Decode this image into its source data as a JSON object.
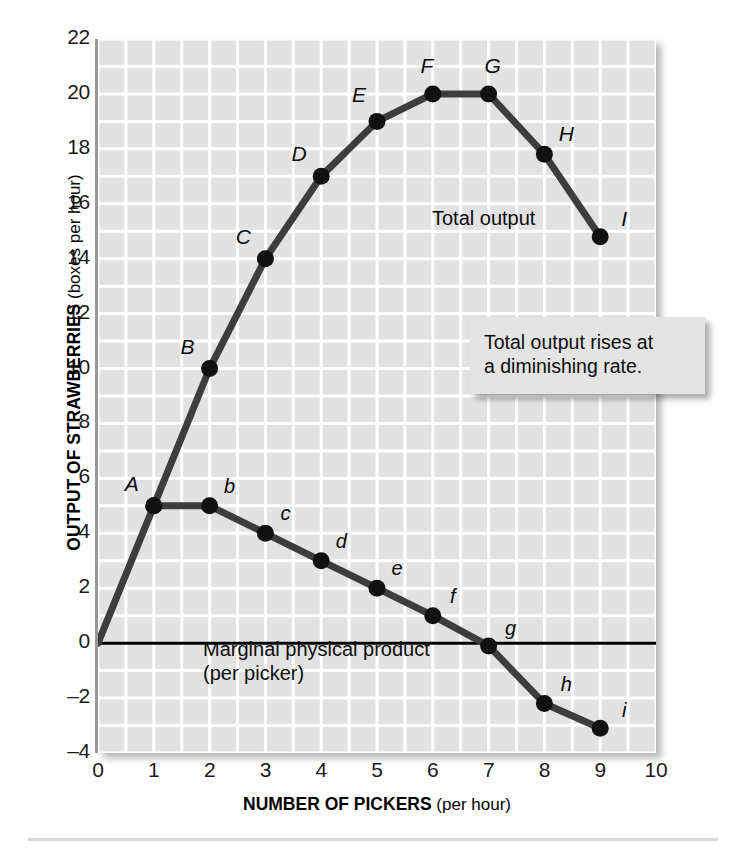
{
  "chart_data": {
    "type": "line",
    "title": "",
    "xlabel": "NUMBER OF PICKERS",
    "xlabel_sub": "(per hour)",
    "ylabel": "OUTPUT OF STRAWBERRIES",
    "ylabel_sub": "(boxes per hour)",
    "xlim": [
      0,
      10
    ],
    "ylim": [
      -4,
      22
    ],
    "xticks": [
      "0",
      "1",
      "2",
      "3",
      "4",
      "5",
      "6",
      "7",
      "8",
      "9",
      "10"
    ],
    "xtick_values": [
      0,
      1,
      2,
      3,
      4,
      5,
      6,
      7,
      8,
      9,
      10
    ],
    "yticks": [
      "22",
      "20",
      "18",
      "16",
      "14",
      "12",
      "10",
      "8",
      "6",
      "4",
      "2",
      "0",
      "–2",
      "–4"
    ],
    "ytick_values": [
      22,
      20,
      18,
      16,
      14,
      12,
      10,
      8,
      6,
      4,
      2,
      0,
      -2,
      -4
    ],
    "grid": true,
    "grid_x_step": 0.5,
    "grid_y_step": 1,
    "grid_color": "#ffffff",
    "plot_bg": "#e2e2e2",
    "legend": "none",
    "series": [
      {
        "name": "Total output",
        "label": "Total output",
        "color": "#3d3d3d",
        "x": [
          0,
          1,
          2,
          3,
          4,
          5,
          6,
          7,
          8,
          9
        ],
        "values": [
          0,
          5,
          10,
          14,
          17,
          19,
          20,
          20,
          17.8,
          14.8
        ],
        "point_labels": [
          "",
          "A",
          "B",
          "C",
          "D",
          "E",
          "F",
          "G",
          "H",
          "I"
        ]
      },
      {
        "name": "Marginal physical product",
        "label": "Marginal physical product",
        "label_sub": "(per picker)",
        "color": "#3d3d3d",
        "x": [
          1,
          2,
          3,
          4,
          5,
          6,
          7,
          8,
          9
        ],
        "values": [
          5,
          5,
          4,
          3,
          2,
          1,
          -0.1,
          -2.2,
          -3.1
        ],
        "point_labels": [
          "a",
          "b",
          "c",
          "d",
          "e",
          "f",
          "g",
          "h",
          "i"
        ]
      }
    ],
    "zero_line": {
      "value": 0,
      "color": "#000000"
    },
    "annotations": [
      {
        "name": "diminishing-rate-callout",
        "line1": "Total output rises at",
        "line2": "a diminishing rate."
      }
    ]
  },
  "axis": {
    "y_title_main": "OUTPUT OF STRAWBERRIES",
    "y_title_sub": "(boxes per hour)",
    "x_title_main": "NUMBER OF PICKERS",
    "x_title_sub": "(per hour)"
  },
  "labels": {
    "total_output": "Total output",
    "mpp_line1": "Marginal physical product",
    "mpp_line2": "(per picker)"
  },
  "callout": {
    "line1": "Total output rises at",
    "line2": "a diminishing rate."
  },
  "colors": {
    "plot_background": "#e2e2e2",
    "grid": "#ffffff",
    "curve": "#3d3d3d",
    "marker": "#111111",
    "zero_line": "#000000",
    "text": "#111111"
  }
}
